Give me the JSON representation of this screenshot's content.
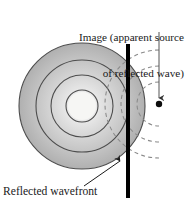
{
  "figure": {
    "title_label": {
      "line1": "Image (apparent source",
      "line2": "of reflected wave)"
    },
    "wavefront_label": "Reflected wavefront"
  },
  "colors": {
    "ink": "#1a1a1a",
    "barrier": "#000000",
    "wave_fill_outer": "#b3b3b3",
    "wave_fill_inner": "#f2f2f2",
    "wave_stroke": "#4d4d4d",
    "dashed_stroke": "#808080",
    "leader": "#555555",
    "background": "#ffffff"
  },
  "geometry": {
    "source": {
      "cx": 82,
      "cy": 106
    },
    "image_point": {
      "cx": 159,
      "cy": 104,
      "r": 3.2
    },
    "barrier": {
      "x": 128,
      "y_top": 44,
      "y_bottom": 198,
      "width": 4
    },
    "wave_radii": [
      16,
      31,
      46,
      63
    ],
    "dashed_radii": [
      22,
      38,
      54
    ],
    "leader_line": {
      "x": 159,
      "y_start": 32,
      "y_end": 98
    },
    "wavefront_arrow": {
      "x1": 86,
      "y1": 185,
      "x2": 121,
      "y2": 161
    }
  }
}
